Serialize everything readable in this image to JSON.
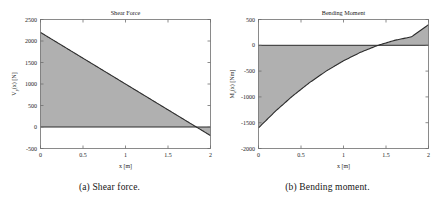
{
  "figures": [
    {
      "id": "shear-force",
      "caption": "(a) Shear force.",
      "chart_data": {
        "type": "area",
        "title": "Shear Force",
        "xlabel": "x [m]",
        "ylabel": "V_y(x) [N]",
        "ylabel_main": "V",
        "ylabel_sub": "y",
        "ylabel_rest": "(x) [N]",
        "xlim": [
          0,
          2
        ],
        "ylim": [
          -500,
          2500
        ],
        "xticks": [
          "0",
          "0.5",
          "1",
          "1.5",
          "2"
        ],
        "xtick_values": [
          0,
          0.5,
          1,
          1.5,
          2
        ],
        "yticks": [
          "-500",
          "0",
          "500",
          "1000",
          "1500",
          "2000",
          "2500"
        ],
        "ytick_values": [
          -500,
          0,
          500,
          1000,
          1500,
          2000,
          2500
        ],
        "grid": false,
        "legend": "none",
        "series": [
          {
            "name": "V_y(x)",
            "x": [
              0,
              0.25,
              0.5,
              0.75,
              1,
              1.25,
              1.5,
              1.75,
              1.8333,
              2
            ],
            "values": [
              2200,
              1900,
              1600,
              1300,
              1000,
              700,
              400,
              100,
              0,
              -200
            ]
          }
        ],
        "zero_crossing_x": 1.8333,
        "fill_color": "#b0b0b0",
        "line_color": "#2b2b2b",
        "axis_color": "#6e6e6e"
      }
    },
    {
      "id": "bending-moment",
      "caption": "(b) Bending moment.",
      "chart_data": {
        "type": "area",
        "title": "Bending Moment",
        "xlabel": "x [m]",
        "ylabel": "M_z(x) [Nm]",
        "ylabel_main": "M",
        "ylabel_sub": "z",
        "ylabel_rest": "(x) [Nm]",
        "xlim": [
          0,
          2
        ],
        "ylim": [
          -2000,
          500
        ],
        "xticks": [
          "0",
          "0.5",
          "1",
          "1.5",
          "2"
        ],
        "xtick_values": [
          0,
          0.5,
          1,
          1.5,
          2
        ],
        "yticks": [
          "-2000",
          "-1500",
          "-1000",
          "-500",
          "0",
          "500"
        ],
        "ytick_values": [
          -2000,
          -1500,
          -1000,
          -500,
          0,
          500
        ],
        "grid": false,
        "legend": "none",
        "series": [
          {
            "name": "M_z(x)",
            "x": [
              0,
              0.2,
              0.4,
              0.6,
              0.8,
              1.0,
              1.2,
              1.4,
              1.6,
              1.8,
              2.0
            ],
            "values": [
              -1600,
              -1276,
              -984,
              -724,
              -496,
              -300,
              -136,
              -4,
              96,
              164,
              400
            ]
          }
        ],
        "zero_crossing_x": 1.02,
        "peak_value": 400,
        "peak_x": 1.85,
        "fill_color": "#b0b0b0",
        "line_color": "#2b2b2b",
        "axis_color": "#6e6e6e"
      }
    }
  ]
}
